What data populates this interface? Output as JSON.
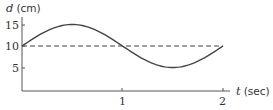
{
  "chart_data": {
    "type": "line",
    "title": "",
    "xlabel": "t (sec)",
    "ylabel": "d (cm)",
    "x_var": "t",
    "x_unit": "(sec)",
    "y_var": "d",
    "y_unit": "(cm)",
    "xlim": [
      0,
      2
    ],
    "ylim": [
      0,
      17
    ],
    "x_ticks": [
      "1",
      "2"
    ],
    "y_ticks": [
      "5",
      "10",
      "15"
    ],
    "grid": false,
    "series": [
      {
        "name": "d(t)",
        "style": "solid",
        "x": [
          0,
          0.25,
          0.5,
          0.75,
          1.0,
          1.25,
          1.5,
          1.75,
          2.0
        ],
        "values": [
          10,
          13.5,
          15,
          13.5,
          10,
          6.5,
          5,
          6.5,
          10
        ]
      },
      {
        "name": "midline",
        "style": "dashed",
        "x": [
          0,
          2
        ],
        "values": [
          10,
          10
        ]
      }
    ],
    "colors": {
      "curve": "#444444",
      "axes": "#555555",
      "dashed": "#444444"
    }
  }
}
